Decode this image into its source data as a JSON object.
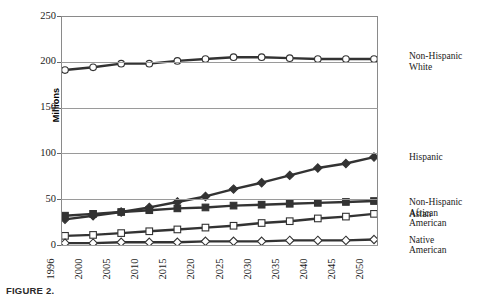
{
  "figure": {
    "caption": "FIGURE 2.",
    "ylabel": "Millions"
  },
  "chart_data": {
    "type": "line",
    "title": "",
    "xlabel": "",
    "ylabel": "Millions",
    "ylim": [
      0,
      250
    ],
    "yticks": [
      0,
      50,
      100,
      150,
      200,
      250
    ],
    "grid": true,
    "legend_position": "right",
    "categories": [
      "1996",
      "2000",
      "2005",
      "2010",
      "2015",
      "2020",
      "2025",
      "2030",
      "2035",
      "2040",
      "2045",
      "2050"
    ],
    "series": [
      {
        "name": "Non-Hispanic White",
        "marker": "circle-open",
        "color": "#333333",
        "values": [
          191,
          194,
          198,
          198,
          201,
          203,
          205,
          205,
          204,
          203,
          203,
          203
        ]
      },
      {
        "name": "Hispanic",
        "marker": "diamond-filled",
        "color": "#333333",
        "values": [
          28,
          32,
          36,
          41,
          47,
          53,
          61,
          68,
          76,
          84,
          89,
          96
        ]
      },
      {
        "name": "Non-Hispanic African American",
        "marker": "square-filled",
        "color": "#333333",
        "values": [
          32,
          34,
          36,
          38,
          40,
          41,
          43,
          44,
          45,
          46,
          47,
          48
        ]
      },
      {
        "name": "Asian",
        "marker": "square-open",
        "color": "#333333",
        "values": [
          10,
          11,
          13,
          15,
          17,
          19,
          21,
          24,
          26,
          29,
          31,
          34
        ]
      },
      {
        "name": "Native American",
        "marker": "diamond-open",
        "color": "#333333",
        "values": [
          2,
          2,
          3,
          3,
          3,
          4,
          4,
          4,
          5,
          5,
          5,
          6
        ]
      }
    ]
  },
  "legend": {
    "entries": [
      {
        "label": "Non-Hispanic\nWhite"
      },
      {
        "label": "Hispanic"
      },
      {
        "label": "Non-Hispanic\nAfrican\nAmerican"
      },
      {
        "label": "Asian"
      },
      {
        "label": "Native\nAmerican"
      }
    ]
  }
}
